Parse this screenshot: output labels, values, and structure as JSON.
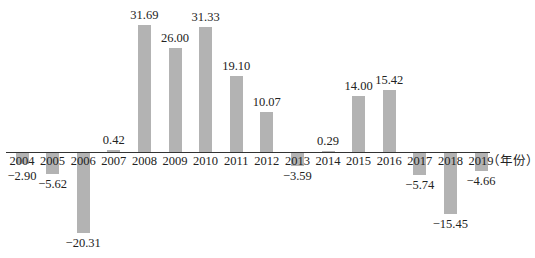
{
  "chart_data": {
    "type": "bar",
    "title": "",
    "xlabel": "（年份）",
    "ylabel": "",
    "categories": [
      "2004",
      "2005",
      "2006",
      "2007",
      "2008",
      "2009",
      "2010",
      "2011",
      "2012",
      "2013",
      "2014",
      "2015",
      "2016",
      "2017",
      "2018",
      "2019"
    ],
    "values": [
      -2.9,
      -5.62,
      -20.31,
      0.42,
      31.69,
      26.0,
      31.33,
      19.1,
      10.07,
      -3.59,
      0.29,
      14.0,
      15.42,
      -5.74,
      -15.45,
      -4.66
    ],
    "value_labels": [
      "−2.90",
      "−5.62",
      "−20.31",
      "0.42",
      "31.69",
      "26.00",
      "31.33",
      "19.10",
      "10.07",
      "−3.59",
      "0.29",
      "14.00",
      "15.42",
      "−5.74",
      "−15.45",
      "−4.66"
    ],
    "ylim": [
      -21,
      32
    ],
    "grid": false,
    "legend": null,
    "bar_color": "#b3b3b3",
    "axis_color": "#333333"
  }
}
